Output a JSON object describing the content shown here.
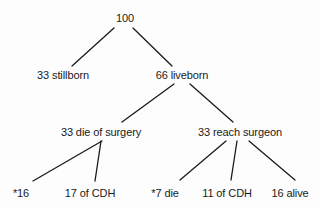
{
  "diagram": {
    "type": "tree",
    "line_color": "#1a1a1a",
    "text_color": "#1a1a1a",
    "nodes": {
      "root": {
        "label": "100",
        "cx": 125,
        "y": 12
      },
      "stillborn": {
        "label": "33 stillborn",
        "cx": 63,
        "y": 69
      },
      "liveborn": {
        "label": "66 liveborn",
        "cx": 182,
        "y": 69
      },
      "die_of_surgery": {
        "label": "33 die of surgery",
        "cx": 101,
        "y": 126
      },
      "reach_surgeon": {
        "label": "33 reach surgeon",
        "cx": 240,
        "y": 126
      },
      "star16": {
        "label": "*16",
        "cx": 21,
        "y": 187
      },
      "of_cdh_17": {
        "label": "17 of CDH",
        "cx": 90,
        "y": 187
      },
      "star7_die": {
        "label": "*7 die",
        "cx": 165,
        "y": 187
      },
      "of_cdh_11": {
        "label": "11 of CDH",
        "cx": 227,
        "y": 187
      },
      "alive_16": {
        "label": "16 alive",
        "cx": 290,
        "y": 187
      }
    },
    "edges": [
      {
        "from": "root",
        "to": "stillborn",
        "x1": 114,
        "y1": 28,
        "x2": 72,
        "y2": 66
      },
      {
        "from": "root",
        "to": "liveborn",
        "x1": 133,
        "y1": 28,
        "x2": 172,
        "y2": 66
      },
      {
        "from": "liveborn",
        "to": "die_of_surgery",
        "x1": 174,
        "y1": 84,
        "x2": 122,
        "y2": 122
      },
      {
        "from": "liveborn",
        "to": "reach_surgeon",
        "x1": 190,
        "y1": 84,
        "x2": 233,
        "y2": 122
      },
      {
        "from": "die_of_surgery",
        "to": "star16",
        "x1": 102,
        "y1": 141,
        "x2": 33,
        "y2": 181
      },
      {
        "from": "die_of_surgery",
        "to": "of_cdh_17",
        "x1": 101,
        "y1": 141,
        "x2": 95,
        "y2": 181
      },
      {
        "from": "reach_surgeon",
        "to": "star7_die",
        "x1": 226,
        "y1": 141,
        "x2": 180,
        "y2": 180
      },
      {
        "from": "reach_surgeon",
        "to": "of_cdh_11",
        "x1": 237,
        "y1": 141,
        "x2": 231,
        "y2": 180
      },
      {
        "from": "reach_surgeon",
        "to": "alive_16",
        "x1": 249,
        "y1": 141,
        "x2": 295,
        "y2": 180
      }
    ]
  }
}
